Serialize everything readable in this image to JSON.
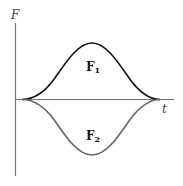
{
  "diagram": {
    "y_axis_label": "F",
    "x_axis_label": "t",
    "curves": [
      {
        "name": "F1",
        "label_main": "F",
        "label_sub": "1",
        "color": "#111111",
        "direction": "positive"
      },
      {
        "name": "F2",
        "label_main": "F",
        "label_sub": "2",
        "color": "#666666",
        "direction": "negative"
      }
    ],
    "colors": {
      "axis": "#777777",
      "background": "#ffffff"
    }
  }
}
